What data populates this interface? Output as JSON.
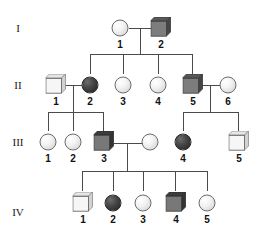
{
  "diagram": {
    "type": "pedigree-chart",
    "generation_labels": [
      "I",
      "II",
      "III",
      "IV"
    ],
    "symbol_key": {
      "circle": "female",
      "square": "male",
      "light_fill": "unaffected",
      "dark_fill": "affected"
    },
    "colors": {
      "line": "#4a4a4a",
      "light_fill": "#f3f3f3",
      "dark_circle_fill": "#3a3a3a",
      "dark_square_fill": "#808080",
      "outline": "#6b6b6b",
      "background": "#ffffff"
    },
    "generations": [
      {
        "label": "I",
        "individuals": [
          {
            "id": "1",
            "shape": "circle",
            "fill": "light"
          },
          {
            "id": "2",
            "shape": "square",
            "fill": "dark"
          }
        ]
      },
      {
        "label": "II",
        "individuals": [
          {
            "id": "1",
            "shape": "square",
            "fill": "light"
          },
          {
            "id": "2",
            "shape": "circle",
            "fill": "dark"
          },
          {
            "id": "3",
            "shape": "circle",
            "fill": "light"
          },
          {
            "id": "4",
            "shape": "circle",
            "fill": "light"
          },
          {
            "id": "5",
            "shape": "square",
            "fill": "dark"
          },
          {
            "id": "6",
            "shape": "circle",
            "fill": "light"
          }
        ]
      },
      {
        "label": "III",
        "individuals": [
          {
            "id": "1",
            "shape": "circle",
            "fill": "light"
          },
          {
            "id": "2",
            "shape": "circle",
            "fill": "light"
          },
          {
            "id": "3",
            "shape": "square",
            "fill": "dark"
          },
          {
            "id": "",
            "shape": "circle",
            "fill": "light"
          },
          {
            "id": "4",
            "shape": "circle",
            "fill": "dark"
          },
          {
            "id": "5",
            "shape": "square",
            "fill": "light"
          }
        ]
      },
      {
        "label": "IV",
        "individuals": [
          {
            "id": "1",
            "shape": "square",
            "fill": "light"
          },
          {
            "id": "2",
            "shape": "circle",
            "fill": "dark"
          },
          {
            "id": "3",
            "shape": "circle",
            "fill": "light"
          },
          {
            "id": "4",
            "shape": "square",
            "fill": "dark"
          },
          {
            "id": "5",
            "shape": "circle",
            "fill": "light"
          }
        ]
      }
    ]
  }
}
